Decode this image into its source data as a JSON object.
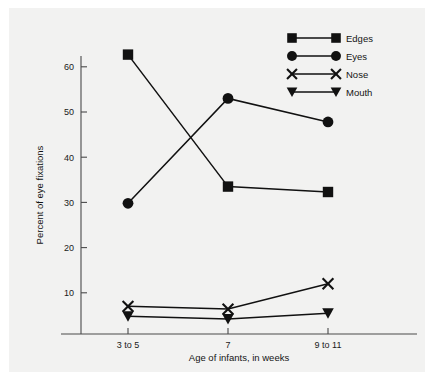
{
  "chart_data": {
    "type": "line",
    "title": "",
    "subtitle": "",
    "xlabel": "Age of infants, in weeks",
    "ylabel": "Percent of eye fixations",
    "categories": [
      "3 to 5",
      "7",
      "9 to 11"
    ],
    "xtick_labels": [
      "3 to 5",
      "7",
      "9 to 11"
    ],
    "ytick_labels": [
      "10",
      "20",
      "30",
      "40",
      "50",
      "60"
    ],
    "ytick_values": [
      10,
      20,
      30,
      40,
      50,
      60
    ],
    "ylim": [
      0,
      65
    ],
    "grid": false,
    "legend_position": "top-right",
    "series": [
      {
        "name": "Edges",
        "marker": "square",
        "values": [
          62.7,
          33.5,
          32.3
        ]
      },
      {
        "name": "Eyes",
        "marker": "circle",
        "values": [
          29.8,
          53.0,
          47.8
        ]
      },
      {
        "name": "Nose",
        "marker": "x",
        "values": [
          7.0,
          6.4,
          12.0
        ]
      },
      {
        "name": "Mouth",
        "marker": "triangle-down",
        "values": [
          4.8,
          4.2,
          5.5
        ]
      }
    ]
  },
  "legend": {
    "items": [
      {
        "label": "Edges",
        "marker": "square"
      },
      {
        "label": "Eyes",
        "marker": "circle"
      },
      {
        "label": "Nose",
        "marker": "x"
      },
      {
        "label": "Mouth",
        "marker": "triangle-down"
      }
    ]
  },
  "colors": {
    "ink": "#111111",
    "axis": "#4a4a4a",
    "panel_background": "#f2f2f1",
    "page_background": "#ffffff"
  }
}
